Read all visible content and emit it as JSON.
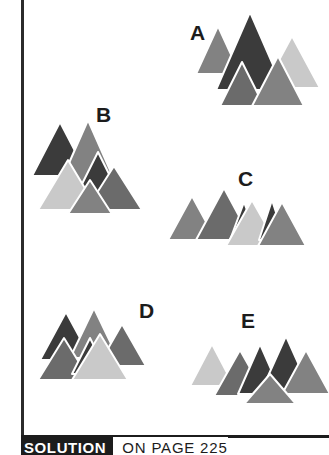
{
  "puzzle": {
    "title_label": "SOLUTION",
    "page_reference": "ON PAGE 225",
    "palette": {
      "dark": "#3b3b3b",
      "mid_dark": "#6b6b6b",
      "mid": "#828282",
      "light": "#c9c9c9",
      "outline": "#ffffff",
      "ink": "#1c1c1c",
      "background": "#ffffff"
    },
    "clusters": [
      {
        "id": "A",
        "label": "A",
        "label_x": 190,
        "label_y": 22,
        "x": 196,
        "y": 4,
        "width": 126,
        "height": 102,
        "triangles": [
          {
            "name": "triangle-a1",
            "tone": "mid",
            "cx": 22,
            "base_y": 70,
            "half_w": 22,
            "height": 48
          },
          {
            "name": "triangle-a2",
            "tone": "dark",
            "cx": 54,
            "base_y": 86,
            "half_w": 34,
            "height": 78
          },
          {
            "name": "triangle-a3",
            "tone": "light",
            "cx": 96,
            "base_y": 84,
            "half_w": 28,
            "height": 52
          },
          {
            "name": "triangle-a4",
            "tone": "mid_dark",
            "cx": 46,
            "base_y": 102,
            "half_w": 22,
            "height": 44
          },
          {
            "name": "triangle-a5",
            "tone": "mid",
            "cx": 82,
            "base_y": 102,
            "half_w": 26,
            "height": 50
          }
        ]
      },
      {
        "id": "B",
        "label": "B",
        "label_x": 96,
        "label_y": 104,
        "x": 30,
        "y": 114,
        "width": 120,
        "height": 100,
        "triangles": [
          {
            "name": "triangle-b1",
            "tone": "dark",
            "cx": 30,
            "base_y": 62,
            "half_w": 28,
            "height": 54
          },
          {
            "name": "triangle-b2",
            "tone": "mid",
            "cx": 58,
            "base_y": 74,
            "half_w": 30,
            "height": 68
          },
          {
            "name": "triangle-b3",
            "tone": "dark",
            "cx": 68,
            "base_y": 86,
            "half_w": 24,
            "height": 48
          },
          {
            "name": "triangle-b4",
            "tone": "light",
            "cx": 38,
            "base_y": 96,
            "half_w": 30,
            "height": 50
          },
          {
            "name": "triangle-b5",
            "tone": "mid_dark",
            "cx": 84,
            "base_y": 96,
            "half_w": 28,
            "height": 44
          },
          {
            "name": "triangle-b6",
            "tone": "mid",
            "cx": 60,
            "base_y": 100,
            "half_w": 22,
            "height": 34
          }
        ]
      },
      {
        "id": "C",
        "label": "C",
        "label_x": 238,
        "label_y": 168,
        "x": 168,
        "y": 178,
        "width": 136,
        "height": 72,
        "triangles": [
          {
            "name": "triangle-c1",
            "tone": "mid",
            "cx": 24,
            "base_y": 62,
            "half_w": 24,
            "height": 44
          },
          {
            "name": "triangle-c2",
            "tone": "mid_dark",
            "cx": 56,
            "base_y": 62,
            "half_w": 28,
            "height": 52
          },
          {
            "name": "triangle-c3",
            "tone": "dark",
            "cx": 76,
            "base_y": 62,
            "half_w": 14,
            "height": 38
          },
          {
            "name": "triangle-c4",
            "tone": "light",
            "cx": 84,
            "base_y": 68,
            "half_w": 26,
            "height": 46
          },
          {
            "name": "triangle-c5",
            "tone": "dark",
            "cx": 104,
            "base_y": 62,
            "half_w": 13,
            "height": 40
          },
          {
            "name": "triangle-c6",
            "tone": "mid",
            "cx": 114,
            "base_y": 68,
            "half_w": 24,
            "height": 44
          }
        ]
      },
      {
        "id": "D",
        "label": "D",
        "label_x": 139,
        "label_y": 300,
        "x": 36,
        "y": 300,
        "width": 120,
        "height": 82,
        "triangles": [
          {
            "name": "triangle-d1",
            "tone": "dark",
            "cx": 30,
            "base_y": 60,
            "half_w": 26,
            "height": 48
          },
          {
            "name": "triangle-d2",
            "tone": "mid",
            "cx": 58,
            "base_y": 58,
            "half_w": 24,
            "height": 50
          },
          {
            "name": "triangle-d3",
            "tone": "mid_dark",
            "cx": 86,
            "base_y": 66,
            "half_w": 24,
            "height": 42
          },
          {
            "name": "triangle-d4",
            "tone": "mid_dark",
            "cx": 28,
            "base_y": 80,
            "half_w": 26,
            "height": 42
          },
          {
            "name": "triangle-d5",
            "tone": "dark",
            "cx": 54,
            "base_y": 74,
            "half_w": 18,
            "height": 36
          },
          {
            "name": "triangle-d6",
            "tone": "light",
            "cx": 64,
            "base_y": 80,
            "half_w": 28,
            "height": 46
          }
        ]
      },
      {
        "id": "E",
        "label": "E",
        "label_x": 241,
        "label_y": 310,
        "x": 188,
        "y": 318,
        "width": 132,
        "height": 86,
        "triangles": [
          {
            "name": "triangle-e1",
            "tone": "light",
            "cx": 24,
            "base_y": 68,
            "half_w": 22,
            "height": 42
          },
          {
            "name": "triangle-e2",
            "tone": "mid_dark",
            "cx": 52,
            "base_y": 78,
            "half_w": 26,
            "height": 46
          },
          {
            "name": "triangle-e3",
            "tone": "dark",
            "cx": 72,
            "base_y": 76,
            "half_w": 22,
            "height": 50
          },
          {
            "name": "triangle-e4",
            "tone": "dark",
            "cx": 98,
            "base_y": 76,
            "half_w": 26,
            "height": 58
          },
          {
            "name": "triangle-e5",
            "tone": "mid",
            "cx": 118,
            "base_y": 76,
            "half_w": 24,
            "height": 44
          },
          {
            "name": "triangle-e6",
            "tone": "mid",
            "cx": 82,
            "base_y": 86,
            "half_w": 26,
            "height": 30
          }
        ]
      }
    ]
  }
}
